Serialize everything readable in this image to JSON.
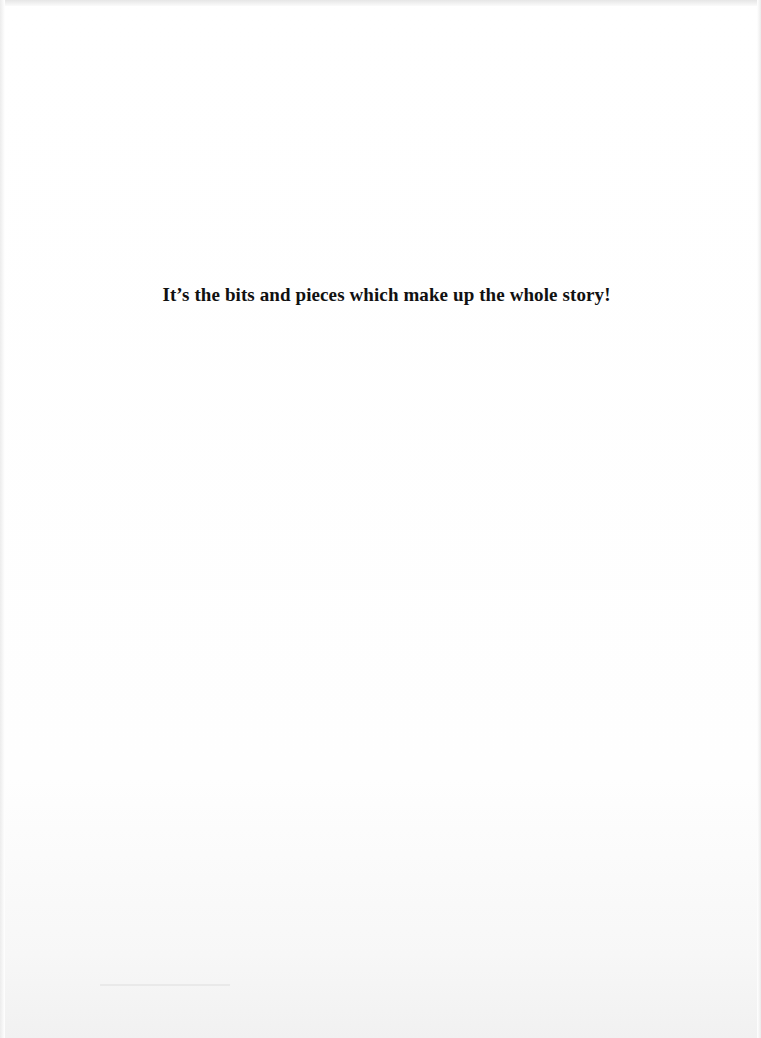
{
  "page": {
    "epigraph": "It’s the bits and pieces which make up the whole story!"
  },
  "colors": {
    "background": "#ffffff",
    "text": "#111111"
  }
}
